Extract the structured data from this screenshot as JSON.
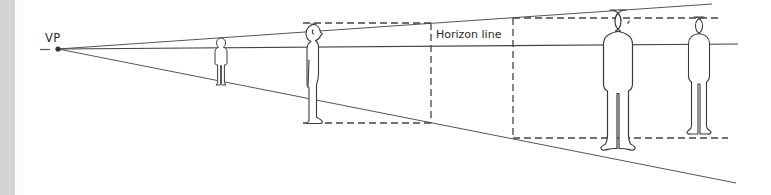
{
  "diagram": {
    "labels": {
      "vanishing_point": "VP",
      "horizon": "Horizon line"
    },
    "colors": {
      "line": "#555555",
      "figure_stroke": "#3a3a3a",
      "side_bar": "#d4d4d4",
      "background": "#ffffff"
    },
    "vanishing_point": {
      "x": 58,
      "y": 49
    },
    "guide_lines": [
      {
        "name": "top-converging-line",
        "end": {
          "x": 712,
          "y": 4
        }
      },
      {
        "name": "horizon-line",
        "end": {
          "x": 738,
          "y": 44
        }
      },
      {
        "name": "bottom-converging-line",
        "end": {
          "x": 736,
          "y": 183
        }
      }
    ],
    "figures": [
      {
        "name": "small-distant-figure",
        "view": "front",
        "x": 221,
        "top": 38,
        "bottom": 86
      },
      {
        "name": "side-view-figure",
        "view": "side",
        "x": 315,
        "top": 24,
        "bottom": 123
      },
      {
        "name": "large-foreground-figure",
        "view": "front",
        "x": 626,
        "top": 10,
        "bottom": 167
      },
      {
        "name": "right-figure",
        "view": "front",
        "x": 704,
        "top": 17,
        "bottom": 138
      }
    ],
    "measure_boxes": [
      {
        "name": "box-near-side-figure",
        "x1": 303,
        "x2": 431,
        "top": 23,
        "bottom": 123
      },
      {
        "name": "box-right",
        "x1": 513,
        "x2": 728,
        "top": 18,
        "bottom": 138
      }
    ]
  }
}
